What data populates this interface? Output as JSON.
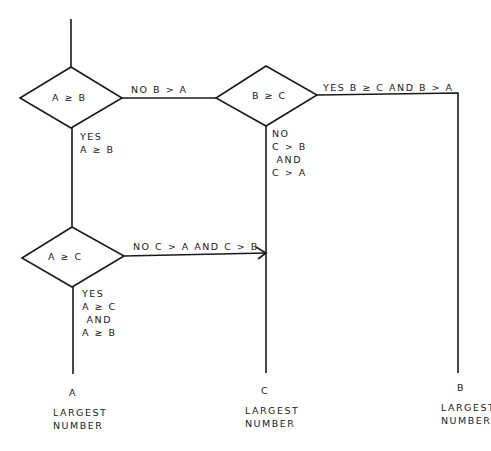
{
  "diagram": {
    "type": "flowchart",
    "decisions": [
      {
        "id": "d1",
        "label": "A ≥ B"
      },
      {
        "id": "d2",
        "label": "B ≥ C"
      },
      {
        "id": "d3",
        "label": "A ≥ C"
      }
    ],
    "edges": [
      {
        "from": "d1",
        "to": "d2",
        "label": "NO B > A"
      },
      {
        "from": "d1",
        "to": "d3",
        "label_lines": [
          "YES",
          "A ≥ B"
        ]
      },
      {
        "from": "d2",
        "to": "out_b",
        "label": "YES B ≥ C AND B > A"
      },
      {
        "from": "d2",
        "to": "out_c",
        "label_lines": [
          "NO",
          "C > B",
          " AND",
          "C > A"
        ]
      },
      {
        "from": "d3",
        "to": "out_c",
        "label": "NO C > A AND C > B"
      },
      {
        "from": "d3",
        "to": "out_a",
        "label_lines": [
          "YES",
          "A ≥ C",
          " AND",
          "A ≥ B"
        ]
      }
    ],
    "outputs": [
      {
        "id": "out_a",
        "letter": "A",
        "line1": "LARGEST",
        "line2": "NUMBER"
      },
      {
        "id": "out_c",
        "letter": "C",
        "line1": "LARGEST",
        "line2": "NUMBER"
      },
      {
        "id": "out_b",
        "letter": "B",
        "line1": "LARGEST",
        "line2": "NUMBER"
      }
    ]
  }
}
